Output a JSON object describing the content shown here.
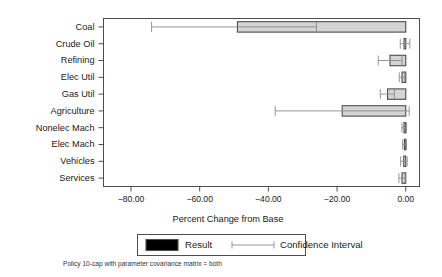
{
  "chart_data": {
    "type": "bar",
    "orientation": "horizontal",
    "title": "",
    "xlabel": "Percent Change from Base",
    "ylabel": "",
    "xlim": [
      -88.0,
      4.0
    ],
    "xticks": [
      -80,
      -60,
      -40,
      -20,
      0
    ],
    "xtick_labels": [
      "-80.00",
      "-60.00",
      "-40.00",
      "-20.00",
      "0.00"
    ],
    "grid": false,
    "legend_position": "below-axes",
    "categories": [
      "Coal",
      "Crude Oil",
      "Refining",
      "Elec Util",
      "Gas Util",
      "Agriculture",
      "Nonelec Mach",
      "Elec Mach",
      "Vehicles",
      "Services"
    ],
    "series": [
      {
        "name": "Result",
        "values": [
          -49.0,
          -0.5,
          -4.6,
          -1.1,
          -5.3,
          -18.5,
          -0.5,
          -0.4,
          -0.6,
          -1.1
        ]
      }
    ],
    "confidence_intervals": {
      "name": "Confidence Interval",
      "lower": [
        -74.0,
        -1.6,
        -8.0,
        -1.9,
        -7.4,
        -38.0,
        -1.1,
        -0.9,
        -1.5,
        -2.0
      ],
      "upper": [
        -26.0,
        1.2,
        -1.1,
        -0.3,
        -3.3,
        1.0,
        0.2,
        0.2,
        0.4,
        -0.2
      ]
    },
    "legend_entries": [
      "Result",
      "Confidence Interval"
    ],
    "caption": "Policy 10-cap with parameter covariance matrix = both",
    "colors": {
      "bar_fill": "#d4d4d4",
      "bar_edge": "#4d4d4d",
      "ci_line": "#8a8a8a",
      "frame": "#4d4d4d",
      "background": "#ffffff",
      "text": "#1a1a1a"
    }
  }
}
